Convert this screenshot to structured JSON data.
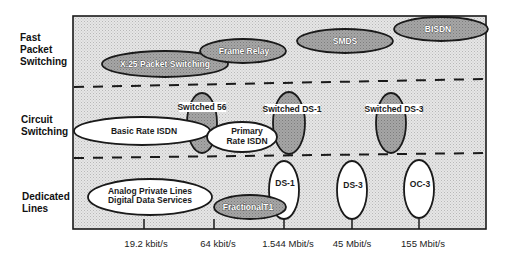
{
  "rows": [
    {
      "label_lines": [
        "Fast",
        "Packet",
        "Switching"
      ]
    },
    {
      "label_lines": [
        "Circuit",
        "Switching"
      ]
    },
    {
      "label_lines": [
        "Dedicated",
        "Lines"
      ]
    }
  ],
  "axis": {
    "ticks": [
      {
        "label": "19.2 kbit/s",
        "x": 144
      },
      {
        "label": "64 kbit/s",
        "x": 214
      },
      {
        "label": "1.544 Mbit/s",
        "x": 284
      },
      {
        "label": "45 Mbit/s",
        "x": 352
      },
      {
        "label": "155 Mbit/s",
        "x": 419
      }
    ]
  },
  "services": {
    "x25": "X.25 Packet Switching",
    "frame_relay": "Frame Relay",
    "smds": "SMDS",
    "bisdn": "BISDN",
    "switched56": "Switched 56",
    "switched_ds1": "Switched DS-1",
    "switched_ds3": "Switched DS-3",
    "basic_rate_isdn": "Basic Rate ISDN",
    "primary_rate_isdn_1": "Primary",
    "primary_rate_isdn_2": "Rate ISDN",
    "analog_private_lines": "Analog Private Lines",
    "digital_data_services": "Digital Data Services",
    "fractional_t1": "FractionalT1",
    "ds1": "DS-1",
    "ds3": "DS-3",
    "oc3": "OC-3"
  },
  "colors": {
    "frame_bg": "#dcdcdc",
    "shaded_ellipse": "#a8a8a8",
    "white_ellipse": "#ffffff",
    "stroke": "#1a1a1a"
  }
}
